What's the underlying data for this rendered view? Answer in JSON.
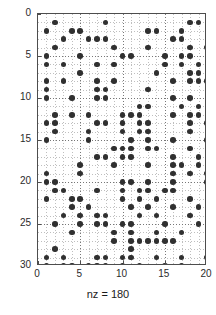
{
  "figure": {
    "type": "spy-sparsity-plot",
    "xlabel": "nz = 180",
    "marker_color": "#303030",
    "axis_color": "#4d4d4d",
    "grid_color": "#707070",
    "background": "#ffffff"
  },
  "axes": {
    "x_ticks": [
      "0",
      "5",
      "10",
      "15",
      "20"
    ],
    "y_ticks": [
      "0",
      "5",
      "10",
      "15",
      "20",
      "25",
      "30"
    ],
    "x_tick_values": [
      0,
      5,
      10,
      15,
      20
    ],
    "y_tick_values": [
      0,
      5,
      10,
      15,
      20,
      25,
      30
    ],
    "xlim": [
      0,
      20
    ],
    "ylim": [
      0,
      30
    ],
    "y_direction": "reverse",
    "grid": true,
    "minor_grid": true
  },
  "chart_data": {
    "type": "scatter",
    "title": "",
    "xlabel": "nz = 180",
    "ylabel": "",
    "xlim": [
      0,
      20
    ],
    "ylim": [
      30,
      0
    ],
    "grid": true,
    "legend": "none",
    "nz": 180,
    "n_rows": 30,
    "n_cols": 20,
    "points": [
      [
        2,
        1
      ],
      [
        8,
        1
      ],
      [
        18,
        1
      ],
      [
        19,
        1
      ],
      [
        1,
        2
      ],
      [
        4,
        2
      ],
      [
        5,
        2
      ],
      [
        13,
        2
      ],
      [
        14,
        2
      ],
      [
        17,
        2
      ],
      [
        3,
        3
      ],
      [
        6,
        3
      ],
      [
        7,
        3
      ],
      [
        8,
        3
      ],
      [
        16,
        3
      ],
      [
        17,
        3
      ],
      [
        2,
        4
      ],
      [
        9,
        4
      ],
      [
        13,
        4
      ],
      [
        18,
        4
      ],
      [
        20,
        4
      ],
      [
        1,
        5
      ],
      [
        5,
        5
      ],
      [
        10,
        5
      ],
      [
        11,
        5
      ],
      [
        15,
        5
      ],
      [
        17,
        5
      ],
      [
        18,
        5
      ],
      [
        1,
        6
      ],
      [
        3,
        6
      ],
      [
        7,
        6
      ],
      [
        9,
        6
      ],
      [
        15,
        6
      ],
      [
        17,
        6
      ],
      [
        19,
        6
      ],
      [
        5,
        7
      ],
      [
        14,
        7
      ],
      [
        18,
        7
      ],
      [
        19,
        7
      ],
      [
        1,
        8
      ],
      [
        3,
        8
      ],
      [
        7,
        8
      ],
      [
        9,
        8
      ],
      [
        16,
        8
      ],
      [
        18,
        8
      ],
      [
        19,
        8
      ],
      [
        20,
        8
      ],
      [
        1,
        9
      ],
      [
        7,
        9
      ],
      [
        8,
        9
      ],
      [
        13,
        9
      ],
      [
        1,
        10
      ],
      [
        4,
        10
      ],
      [
        7,
        10
      ],
      [
        8,
        10
      ],
      [
        16,
        10
      ],
      [
        18,
        10
      ],
      [
        12,
        11
      ],
      [
        13,
        11
      ],
      [
        17,
        11
      ],
      [
        19,
        11
      ],
      [
        2,
        12
      ],
      [
        4,
        12
      ],
      [
        6,
        12
      ],
      [
        10,
        12
      ],
      [
        11,
        12
      ],
      [
        12,
        12
      ],
      [
        16,
        12
      ],
      [
        18,
        12
      ],
      [
        19,
        12
      ],
      [
        1,
        13
      ],
      [
        2,
        13
      ],
      [
        7,
        13
      ],
      [
        8,
        13
      ],
      [
        10,
        13
      ],
      [
        12,
        13
      ],
      [
        13,
        13
      ],
      [
        18,
        13
      ],
      [
        20,
        13
      ],
      [
        2,
        14
      ],
      [
        6,
        14
      ],
      [
        10,
        14
      ],
      [
        12,
        14
      ],
      [
        13,
        14
      ],
      [
        18,
        14
      ],
      [
        1,
        15
      ],
      [
        6,
        15
      ],
      [
        11,
        15
      ],
      [
        13,
        15
      ],
      [
        16,
        15
      ],
      [
        20,
        15
      ],
      [
        9,
        16
      ],
      [
        10,
        16
      ],
      [
        11,
        16
      ],
      [
        13,
        16
      ],
      [
        14,
        16
      ],
      [
        18,
        16
      ],
      [
        7,
        17
      ],
      [
        8,
        17
      ],
      [
        10,
        17
      ],
      [
        11,
        17
      ],
      [
        16,
        17
      ],
      [
        19,
        17
      ],
      [
        5,
        18
      ],
      [
        9,
        18
      ],
      [
        13,
        18
      ],
      [
        16,
        18
      ],
      [
        17,
        18
      ],
      [
        19,
        18
      ],
      [
        1,
        19
      ],
      [
        5,
        19
      ],
      [
        16,
        19
      ],
      [
        18,
        19
      ],
      [
        20,
        19
      ],
      [
        1,
        20
      ],
      [
        2,
        20
      ],
      [
        10,
        20
      ],
      [
        11,
        20
      ],
      [
        13,
        20
      ],
      [
        16,
        20
      ],
      [
        20,
        20
      ],
      [
        2,
        21
      ],
      [
        3,
        21
      ],
      [
        7,
        21
      ],
      [
        10,
        21
      ],
      [
        12,
        21
      ],
      [
        13,
        21
      ],
      [
        15,
        21
      ],
      [
        16,
        21
      ],
      [
        1,
        22
      ],
      [
        4,
        22
      ],
      [
        5,
        22
      ],
      [
        10,
        22
      ],
      [
        12,
        22
      ],
      [
        14,
        22
      ],
      [
        18,
        22
      ],
      [
        4,
        23
      ],
      [
        6,
        23
      ],
      [
        11,
        23
      ],
      [
        13,
        23
      ],
      [
        16,
        23
      ],
      [
        19,
        23
      ],
      [
        3,
        24
      ],
      [
        5,
        24
      ],
      [
        7,
        24
      ],
      [
        8,
        24
      ],
      [
        12,
        24
      ],
      [
        14,
        24
      ],
      [
        18,
        24
      ],
      [
        2,
        25
      ],
      [
        5,
        25
      ],
      [
        7,
        25
      ],
      [
        8,
        25
      ],
      [
        10,
        25
      ],
      [
        11,
        25
      ],
      [
        15,
        25
      ],
      [
        19,
        25
      ],
      [
        4,
        26
      ],
      [
        9,
        26
      ],
      [
        11,
        26
      ],
      [
        14,
        26
      ],
      [
        17,
        26
      ],
      [
        9,
        27
      ],
      [
        11,
        27
      ],
      [
        12,
        27
      ],
      [
        13,
        27
      ],
      [
        14,
        27
      ],
      [
        15,
        27
      ],
      [
        16,
        27
      ],
      [
        2,
        28
      ],
      [
        11,
        28
      ],
      [
        1,
        29
      ],
      [
        3,
        29
      ],
      [
        7,
        29
      ],
      [
        8,
        29
      ],
      [
        10,
        29
      ],
      [
        11,
        29
      ],
      [
        14,
        29
      ],
      [
        17,
        29
      ],
      [
        20,
        29
      ],
      [
        1,
        30
      ],
      [
        3,
        30
      ],
      [
        4,
        30
      ],
      [
        6,
        30
      ],
      [
        7,
        30
      ],
      [
        8,
        30
      ],
      [
        10,
        30
      ],
      [
        12,
        30
      ],
      [
        15,
        30
      ],
      [
        17,
        30
      ]
    ]
  }
}
